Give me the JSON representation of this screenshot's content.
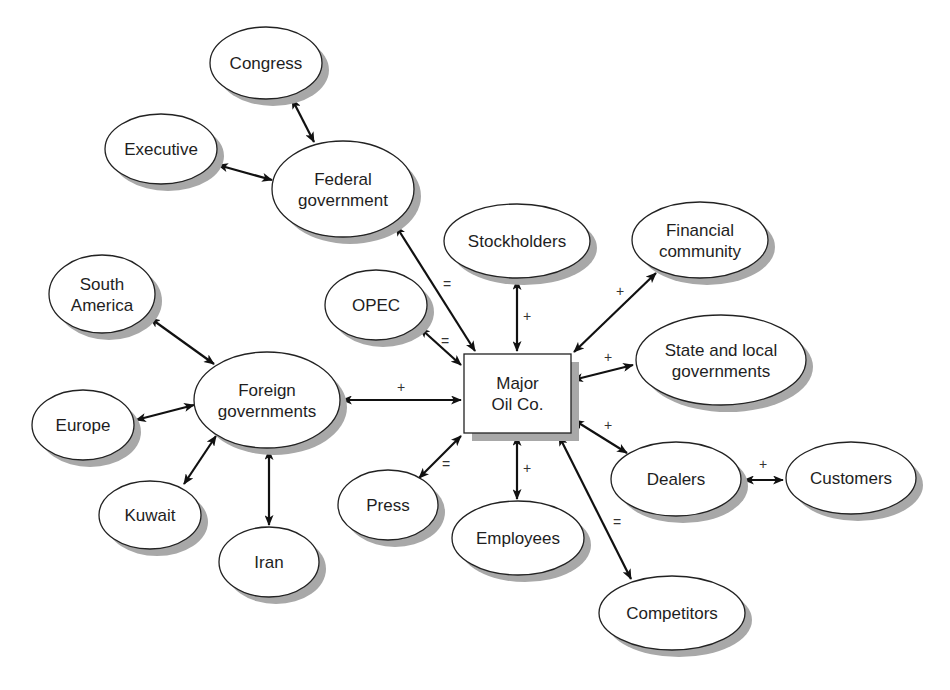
{
  "diagram": {
    "title": "",
    "type": "stakeholder-map",
    "colors": {
      "background": "#ffffff",
      "stroke": "#222222",
      "shadow": "#a8a8a8",
      "text": "#1e1e1e"
    },
    "center": {
      "id": "major",
      "lines": [
        "Major",
        "Oil Co."
      ],
      "shape": "rect",
      "x": 464,
      "y": 354,
      "w": 107,
      "h": 79
    },
    "nodes": [
      {
        "id": "congress",
        "lines": [
          "Congress"
        ],
        "cx": 266,
        "cy": 63,
        "rx": 56,
        "ry": 36
      },
      {
        "id": "executive",
        "lines": [
          "Executive"
        ],
        "cx": 161,
        "cy": 149,
        "rx": 56,
        "ry": 35
      },
      {
        "id": "federal",
        "lines": [
          "Federal",
          "government"
        ],
        "cx": 343,
        "cy": 189,
        "rx": 71,
        "ry": 48
      },
      {
        "id": "stockholders",
        "lines": [
          "Stockholders"
        ],
        "cx": 517,
        "cy": 241,
        "rx": 73,
        "ry": 37
      },
      {
        "id": "financial",
        "lines": [
          "Financial",
          "community"
        ],
        "cx": 700,
        "cy": 240,
        "rx": 68,
        "ry": 38
      },
      {
        "id": "opec",
        "lines": [
          "OPEC"
        ],
        "cx": 376,
        "cy": 305,
        "rx": 51,
        "ry": 35
      },
      {
        "id": "southam",
        "lines": [
          "South",
          "America"
        ],
        "cx": 102,
        "cy": 294,
        "rx": 53,
        "ry": 39
      },
      {
        "id": "state",
        "lines": [
          "State and local",
          "governments"
        ],
        "cx": 721,
        "cy": 360,
        "rx": 85,
        "ry": 45
      },
      {
        "id": "foreign",
        "lines": [
          "Foreign",
          "governments"
        ],
        "cx": 267,
        "cy": 400,
        "rx": 73,
        "ry": 48
      },
      {
        "id": "europe",
        "lines": [
          "Europe"
        ],
        "cx": 83,
        "cy": 425,
        "rx": 51,
        "ry": 35
      },
      {
        "id": "dealers",
        "lines": [
          "Dealers"
        ],
        "cx": 676,
        "cy": 479,
        "rx": 65,
        "ry": 37
      },
      {
        "id": "customers",
        "lines": [
          "Customers"
        ],
        "cx": 851,
        "cy": 478,
        "rx": 65,
        "ry": 36
      },
      {
        "id": "press",
        "lines": [
          "Press"
        ],
        "cx": 388,
        "cy": 505,
        "rx": 50,
        "ry": 35
      },
      {
        "id": "kuwait",
        "lines": [
          "Kuwait"
        ],
        "cx": 150,
        "cy": 515,
        "rx": 51,
        "ry": 34
      },
      {
        "id": "employees",
        "lines": [
          "Employees"
        ],
        "cx": 518,
        "cy": 538,
        "rx": 66,
        "ry": 37
      },
      {
        "id": "iran",
        "lines": [
          "Iran"
        ],
        "cx": 269,
        "cy": 562,
        "rx": 50,
        "ry": 35
      },
      {
        "id": "competitors",
        "lines": [
          "Competitors"
        ],
        "cx": 672,
        "cy": 613,
        "rx": 73,
        "ry": 37
      }
    ],
    "edges": [
      {
        "from": "congress",
        "to": "federal",
        "x1": 292,
        "y1": 99,
        "x2": 314,
        "y2": 142,
        "label": ""
      },
      {
        "from": "executive",
        "to": "federal",
        "x1": 218,
        "y1": 165,
        "x2": 272,
        "y2": 180,
        "label": ""
      },
      {
        "from": "federal",
        "to": "major",
        "x1": 396,
        "y1": 226,
        "x2": 475,
        "y2": 351,
        "label": "=",
        "lx": 447,
        "ly": 289
      },
      {
        "from": "stockholders",
        "to": "major",
        "x1": 517,
        "y1": 280,
        "x2": 517,
        "y2": 351,
        "label": "+",
        "lx": 527,
        "ly": 321
      },
      {
        "from": "financial",
        "to": "major",
        "x1": 656,
        "y1": 273,
        "x2": 574,
        "y2": 352,
        "label": "+",
        "lx": 620,
        "ly": 296
      },
      {
        "from": "opec",
        "to": "major",
        "x1": 420,
        "y1": 328,
        "x2": 461,
        "y2": 365,
        "label": "=",
        "lx": 445,
        "ly": 346
      },
      {
        "from": "state",
        "to": "major",
        "x1": 633,
        "y1": 365,
        "x2": 573,
        "y2": 380,
        "label": "+",
        "lx": 608,
        "ly": 362
      },
      {
        "from": "southam",
        "to": "foreign",
        "x1": 150,
        "y1": 318,
        "x2": 214,
        "y2": 364,
        "label": ""
      },
      {
        "from": "foreign",
        "to": "major",
        "x1": 342,
        "y1": 400,
        "x2": 461,
        "y2": 400,
        "label": "+",
        "lx": 401,
        "ly": 392
      },
      {
        "from": "europe",
        "to": "foreign",
        "x1": 136,
        "y1": 420,
        "x2": 194,
        "y2": 405,
        "label": ""
      },
      {
        "from": "kuwait",
        "to": "foreign",
        "x1": 184,
        "y1": 484,
        "x2": 216,
        "y2": 436,
        "label": ""
      },
      {
        "from": "foreign",
        "to": "iran",
        "x1": 269,
        "y1": 450,
        "x2": 269,
        "y2": 525,
        "label": ""
      },
      {
        "from": "major",
        "to": "dealers",
        "x1": 574,
        "y1": 420,
        "x2": 627,
        "y2": 453,
        "label": "+",
        "lx": 608,
        "ly": 430
      },
      {
        "from": "dealers",
        "to": "customers",
        "x1": 744,
        "y1": 480,
        "x2": 783,
        "y2": 480,
        "label": "+",
        "lx": 763,
        "ly": 469
      },
      {
        "from": "press",
        "to": "major",
        "x1": 419,
        "y1": 478,
        "x2": 461,
        "y2": 436,
        "label": "=",
        "lx": 446,
        "ly": 469
      },
      {
        "from": "major",
        "to": "employees",
        "x1": 517,
        "y1": 436,
        "x2": 517,
        "y2": 499,
        "label": "+",
        "lx": 527,
        "ly": 473
      },
      {
        "from": "major",
        "to": "competitors",
        "x1": 559,
        "y1": 436,
        "x2": 631,
        "y2": 579,
        "label": "=",
        "lx": 617,
        "ly": 527
      }
    ]
  }
}
